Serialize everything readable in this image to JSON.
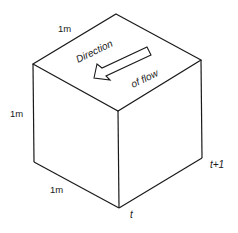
{
  "figure": {
    "type": "isometric cube diagram",
    "labels": {
      "top_edge": "1m",
      "left_edge": "1m",
      "bottom_edge": "1m",
      "direction_word": "Direction",
      "flow_word": "of flow",
      "time_front": "t",
      "time_back": "t+1"
    },
    "colors": {
      "line": "#1a1a1a",
      "background": "#ffffff"
    }
  }
}
